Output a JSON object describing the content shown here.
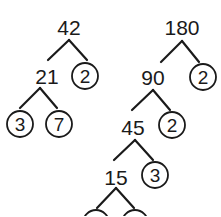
{
  "trees": [
    {
      "name": "factor-tree-42",
      "nodes": [
        {
          "id": "n42",
          "label": "42",
          "x": 69,
          "y": 27,
          "prime": false
        },
        {
          "id": "n21",
          "label": "21",
          "x": 47,
          "y": 76,
          "prime": false
        },
        {
          "id": "p2a",
          "label": "2",
          "x": 85,
          "y": 76,
          "prime": true
        },
        {
          "id": "p3a",
          "label": "3",
          "x": 20,
          "y": 124,
          "prime": true
        },
        {
          "id": "p7",
          "label": "7",
          "x": 59,
          "y": 124,
          "prime": true
        }
      ],
      "edges": [
        [
          69,
          40,
          48,
          60
        ],
        [
          69,
          40,
          87,
          60
        ],
        [
          40,
          88,
          20,
          108
        ],
        [
          40,
          88,
          57,
          108
        ]
      ]
    },
    {
      "name": "factor-tree-180",
      "nodes": [
        {
          "id": "n180",
          "label": "180",
          "x": 182,
          "y": 27,
          "prime": false
        },
        {
          "id": "n90",
          "label": "90",
          "x": 153,
          "y": 77,
          "prime": false
        },
        {
          "id": "p2b",
          "label": "2",
          "x": 203,
          "y": 77,
          "prime": true
        },
        {
          "id": "n45",
          "label": "45",
          "x": 133,
          "y": 127,
          "prime": false
        },
        {
          "id": "p2c",
          "label": "2",
          "x": 172,
          "y": 125,
          "prime": true
        },
        {
          "id": "n15",
          "label": "15",
          "x": 116,
          "y": 177,
          "prime": false
        },
        {
          "id": "p3b",
          "label": "3",
          "x": 155,
          "y": 175,
          "prime": true
        },
        {
          "id": "p3c",
          "label": "3",
          "x": 96,
          "y": 223,
          "prime": true
        },
        {
          "id": "p5",
          "label": "5",
          "x": 135,
          "y": 223,
          "prime": true
        }
      ],
      "edges": [
        [
          182,
          41,
          161,
          62
        ],
        [
          182,
          41,
          199,
          62
        ],
        [
          153,
          90,
          132,
          110
        ],
        [
          153,
          90,
          170,
          110
        ],
        [
          135,
          140,
          114,
          160
        ],
        [
          135,
          140,
          153,
          160
        ],
        [
          116,
          188,
          97,
          208
        ],
        [
          116,
          188,
          134,
          208
        ]
      ]
    }
  ],
  "circle_radius": 13,
  "colors": {
    "ink": "#1a1a1a",
    "background": "#ffffff"
  }
}
